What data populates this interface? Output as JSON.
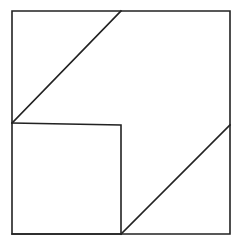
{
  "diagram": {
    "type": "geometric-dissection",
    "canvas": {
      "width": 241,
      "height": 244,
      "background": "#ffffff"
    },
    "stroke_color": "#222222",
    "shapes": [
      {
        "name": "outer-square",
        "points": [
          [
            12,
            11
          ],
          [
            230,
            11
          ],
          [
            230,
            234
          ],
          [
            12,
            234
          ]
        ]
      },
      {
        "name": "inner-square",
        "points": [
          [
            12,
            123
          ],
          [
            121,
            125
          ],
          [
            121,
            234
          ],
          [
            12,
            234
          ]
        ]
      },
      {
        "name": "upper-diagonal",
        "points": [
          [
            12,
            123
          ],
          [
            121,
            11
          ]
        ]
      },
      {
        "name": "lower-diagonal",
        "points": [
          [
            121,
            234
          ],
          [
            230,
            125
          ]
        ]
      }
    ],
    "text": []
  }
}
